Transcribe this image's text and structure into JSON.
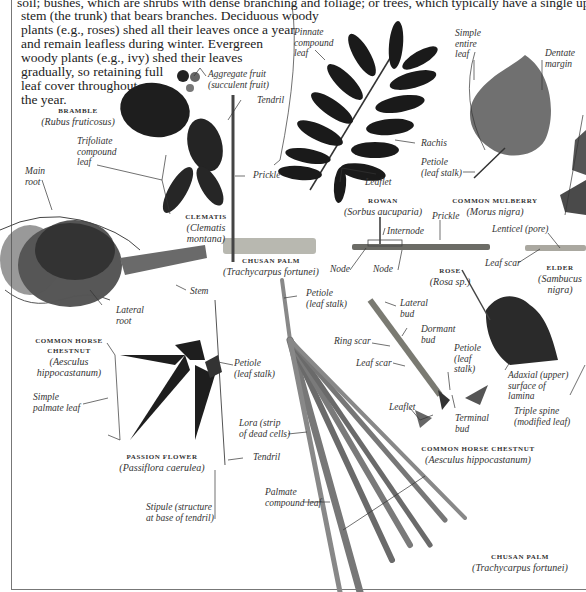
{
  "intro": {
    "lines": [
      "soil; bushes, which are shrubs with dense branching and foliage; or trees, which typically have a single upright",
      "stem (the trunk) that bears branches. Deciduous woody",
      "plants (e.g., roses) shed all their leaves once a year",
      "and remain leafless during winter. Evergreen",
      "woody plants (e.g., ivy) shed their leaves",
      "gradually, so retaining full",
      "leaf cover throughout",
      "the year."
    ]
  },
  "specimens": {
    "bramble": {
      "name": "BRAMBLE",
      "sci": "(Rubus fruticosus)"
    },
    "clematis": {
      "name": "CLEMATIS",
      "sci1": "(Clematis",
      "sci2": "montana)"
    },
    "chusan_palm_stem": {
      "name": "CHUSAN PALM",
      "sci": "(Trachycarpus fortunei)"
    },
    "rowan": {
      "name": "ROWAN",
      "sci": "(Sorbus aucuparia)"
    },
    "mulberry": {
      "name": "COMMON MULBERRY",
      "sci": "(Morus nigra)"
    },
    "rose": {
      "name": "ROSE",
      "sci": "(Rosa sp.)"
    },
    "elder": {
      "name": "ELDER",
      "sci1": "(Sambucus",
      "sci2": "nigra)"
    },
    "horse_chestnut_root": {
      "name1": "COMMON HORSE",
      "name2": "CHESTNUT",
      "sci1": "(Aesculus",
      "sci2": "hippocastanum)"
    },
    "passion_flower": {
      "name": "PASSION FLOWER",
      "sci": "(Passiflora caerulea)"
    },
    "horse_chestnut_twig": {
      "name": "COMMON HORSE CHESTNUT",
      "sci": "(Aesculus hippocastanum)"
    },
    "chusan_palm_leaf": {
      "name": "CHUSAN PALM",
      "sci": "(Trachycarpus fortunei)"
    }
  },
  "labels": {
    "aggregate_fruit": [
      "Aggregate fruit",
      "(succulent fruit)"
    ],
    "tendril_top": "Tendril",
    "trifoliate": [
      "Trifoliate",
      "compound",
      "leaf"
    ],
    "prickle_bramble": "Prickle",
    "main_root": [
      "Main",
      "root"
    ],
    "lateral_root": [
      "Lateral",
      "root"
    ],
    "pinnate": [
      "Pinnate",
      "compound",
      "leaf"
    ],
    "rachis": "Rachis",
    "leaflet_rowan": "Leaflet",
    "simple_entire": [
      "Simple",
      "entire",
      "leaf"
    ],
    "dentate": [
      "Dentate",
      "margin"
    ],
    "petiole_mulberry": [
      "Petiole",
      "(leaf stalk)"
    ],
    "internode": "Internode",
    "prickle_rose": "Prickle",
    "node1": "Node",
    "node2": "Node",
    "lenticel": "Lenticel (pore)",
    "leaf_scar_elder": "Leaf scar",
    "stem": "Stem",
    "petiole_palm": [
      "Petiole",
      "(leaf stalk)"
    ],
    "lateral_bud": [
      "Lateral",
      "bud"
    ],
    "dormant_bud": [
      "Dormant",
      "bud"
    ],
    "ring_scar": "Ring scar",
    "leaf_scar_hc": "Leaf scar",
    "petiole_hc": [
      "Petiole",
      "(leaf",
      "stalk)"
    ],
    "adaxial": [
      "Adaxial (upper)",
      "surface of",
      "lamina"
    ],
    "simple_palmate": [
      "Simple",
      "palmate leaf"
    ],
    "petiole_passion": [
      "Petiole",
      "(leaf stalk)"
    ],
    "lora": [
      "Lora (strip",
      "of dead cells)"
    ],
    "tendril_passion": "Tendril",
    "leaflet_hc": "Leaflet",
    "terminal_bud": [
      "Terminal",
      "bud"
    ],
    "triple_spine": [
      "Triple spine",
      "(modified leaf)"
    ],
    "palmate_compound": [
      "Palmate",
      "compound leaf"
    ],
    "stipule": [
      "Stipule (structure",
      "at base of tendril)"
    ]
  }
}
